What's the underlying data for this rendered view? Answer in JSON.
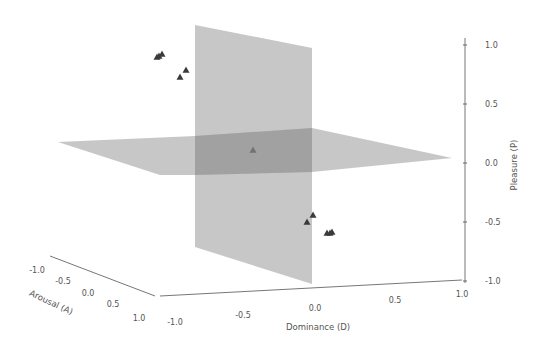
{
  "chart_data": {
    "type": "scatter3d",
    "title": "",
    "note": "All pixel-space values (planes, pixel_markers, tick positions) were measured from the screenshot. The data-space marker coordinates (points[].d/a/p) are rough visual estimates only and were NOT recovered by inverting the 3D projection; treat them as approximate.",
    "axes": {
      "x": {
        "label": "Dominance (D)",
        "range": [
          -1.0,
          1.0
        ],
        "ticks": [
          "-1.0",
          "-0.5",
          "0.0",
          "0.5",
          "1.0"
        ]
      },
      "y": {
        "label": "Arousal (A)",
        "range": [
          -1.0,
          1.0
        ],
        "ticks": [
          "-1.0",
          "-0.5",
          "0.0",
          "0.5",
          "1.0"
        ]
      },
      "z": {
        "label": "Pleasure (P)",
        "range": [
          -1.0,
          1.0
        ],
        "ticks": [
          "1.0",
          "0.5",
          "0.0",
          "-0.5",
          "-1.0"
        ]
      }
    },
    "planes": [
      {
        "name": "Dominance = 0 plane",
        "orientation": "vertical",
        "color": "#bdbdbd"
      },
      {
        "name": "Pleasure = 0 plane",
        "orientation": "horizontal",
        "color": "#bdbdbd"
      }
    ],
    "marker": {
      "shape": "triangle",
      "color": "#3a3a3a"
    },
    "points_precision": "approximate",
    "points": [
      {
        "group": "upper-left cluster",
        "d": -0.6,
        "a": -0.3,
        "p": 0.85
      },
      {
        "group": "upper-left cluster",
        "d": -0.58,
        "a": -0.3,
        "p": 0.86
      },
      {
        "group": "upper-left cluster",
        "d": -0.56,
        "a": -0.3,
        "p": 0.87
      },
      {
        "group": "upper-left",
        "d": -0.45,
        "a": -0.2,
        "p": 0.75
      },
      {
        "group": "upper-left",
        "d": -0.48,
        "a": -0.15,
        "p": 0.7
      },
      {
        "group": "center",
        "d": -0.2,
        "a": 0.0,
        "p": 0.05
      },
      {
        "group": "lower-right",
        "d": 0.02,
        "a": 0.0,
        "p": -0.35
      },
      {
        "group": "lower-right",
        "d": 0.0,
        "a": 0.0,
        "p": -0.4
      },
      {
        "group": "lower-right cluster",
        "d": 0.1,
        "a": 0.0,
        "p": -0.55
      },
      {
        "group": "lower-right cluster",
        "d": 0.12,
        "a": 0.0,
        "p": -0.55
      },
      {
        "group": "lower-right cluster",
        "d": 0.14,
        "a": 0.0,
        "p": -0.55
      }
    ],
    "grid": false,
    "legend": null
  },
  "render": {
    "note": "Pixel-space geometry measured from the screenshot; used only for drawing.",
    "vertical_plane": "195,25 312,48 312,284 195,247",
    "horizontal_plane": "58,142 195,136 312,128 452,158 312,172 195,175 160,175",
    "overlap_region": "195,136 312,128 312,172 195,175",
    "p_axis": {
      "x": 465,
      "y1": 38,
      "y2": 283
    },
    "d_axis": {
      "x1": 160,
      "y1": 296,
      "x2": 462,
      "y2": 280
    },
    "a_axis": {
      "x1": 50,
      "y1": 256,
      "x2": 155,
      "y2": 296
    },
    "p_ticks": [
      {
        "label": "1.0",
        "y": 45
      },
      {
        "label": "0.5",
        "y": 104
      },
      {
        "label": "0.0",
        "y": 163
      },
      {
        "label": "-0.5",
        "y": 222
      },
      {
        "label": "-1.0",
        "y": 281
      }
    ],
    "d_ticks": [
      {
        "label": "-1.0",
        "x": 175,
        "y": 325
      },
      {
        "label": "-0.5",
        "x": 243,
        "y": 318
      },
      {
        "label": "0.0",
        "x": 315,
        "y": 311
      },
      {
        "label": "0.5",
        "x": 395,
        "y": 303
      },
      {
        "label": "1.0",
        "x": 462,
        "y": 297
      }
    ],
    "a_ticks": [
      {
        "label": "-1.0",
        "x": 37,
        "y": 273
      },
      {
        "label": "-0.5",
        "x": 63,
        "y": 284
      },
      {
        "label": "0.0",
        "x": 88,
        "y": 296
      },
      {
        "label": "0.5",
        "x": 113,
        "y": 307
      },
      {
        "label": "1.0",
        "x": 139,
        "y": 321
      }
    ],
    "pixel_markers": [
      {
        "x": 157,
        "y": 57
      },
      {
        "x": 159,
        "y": 56
      },
      {
        "x": 162,
        "y": 54
      },
      {
        "x": 186,
        "y": 70
      },
      {
        "x": 180,
        "y": 77
      },
      {
        "x": 253,
        "y": 150,
        "faint": true
      },
      {
        "x": 313,
        "y": 215
      },
      {
        "x": 307,
        "y": 222
      },
      {
        "x": 327,
        "y": 233
      },
      {
        "x": 330,
        "y": 233
      },
      {
        "x": 332,
        "y": 232
      }
    ],
    "labels": {
      "d": {
        "x": 318,
        "y": 330
      },
      "a": {
        "x": 50,
        "y": 305,
        "rotate": 25
      },
      "p": {
        "x": 517,
        "y": 165,
        "rotate": -90
      }
    }
  }
}
